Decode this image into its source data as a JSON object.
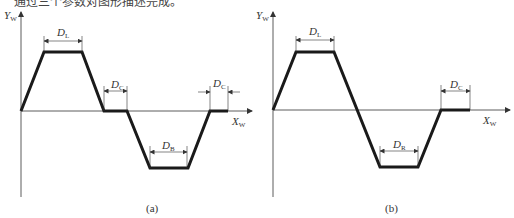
{
  "header_text": "通过三个参数对图形描述完成。",
  "figures": [
    {
      "caption": "(a)",
      "y_axis_label": "Y",
      "y_axis_sub": "W",
      "x_axis_label": "X",
      "x_axis_sub": "W",
      "dimensions": [
        {
          "label": "D",
          "sub": "L"
        },
        {
          "label": "D",
          "sub": "C"
        },
        {
          "label": "D",
          "sub": "B"
        },
        {
          "label": "D",
          "sub": "C"
        }
      ]
    },
    {
      "caption": "(b)",
      "y_axis_label": "Y",
      "y_axis_sub": "W",
      "x_axis_label": "X",
      "x_axis_sub": "W",
      "dimensions": [
        {
          "label": "D",
          "sub": "L"
        },
        {
          "label": "D",
          "sub": "R"
        },
        {
          "label": "D",
          "sub": "C"
        }
      ]
    }
  ]
}
